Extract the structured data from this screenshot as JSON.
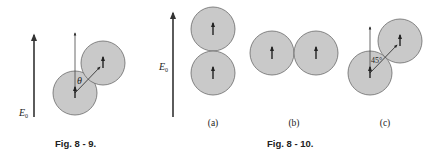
{
  "colors": {
    "sphere_fill": "#c9c9c9",
    "sphere_stroke": "#6a6a6a",
    "line": "#333333",
    "text": "#222222"
  },
  "fig8_9": {
    "caption": "Fig. 8 - 9.",
    "field_label": "E",
    "field_subscript": "0",
    "angle_label": "θ"
  },
  "fig8_10": {
    "caption": "Fig. 8 - 10.",
    "field_label": "E",
    "field_subscript": "0",
    "panels": [
      {
        "label": "(a)",
        "arrangement": "vertical"
      },
      {
        "label": "(b)",
        "arrangement": "horizontal"
      },
      {
        "label": "(c)",
        "arrangement": "diagonal",
        "angle_label": "45°"
      }
    ]
  }
}
